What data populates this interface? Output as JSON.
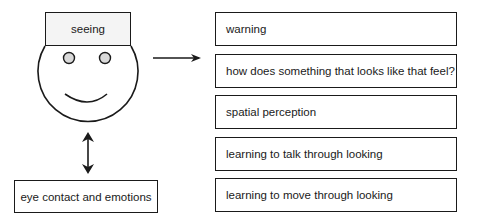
{
  "head_label": "seeing",
  "bottom_box": "eye contact and emotions",
  "list_items": [
    "warning",
    "how does something that looks like that feel?",
    "spatial perception",
    "learning to talk through looking",
    "learning to move through looking"
  ],
  "colors": {
    "stroke": "#1a1a1a",
    "eye_fill": "#d9d9d9",
    "hat_fill": "#f4f4f4"
  }
}
